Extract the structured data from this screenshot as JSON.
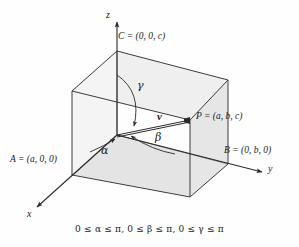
{
  "figure": {
    "background_color": "#fefefe",
    "line_color": "#3c3c3c",
    "face_shade_color": "#e8e8e8",
    "face_shade_color_dark": "#dedede",
    "axes": [
      {
        "name": "z",
        "label": "z"
      },
      {
        "name": "y",
        "label": "y"
      },
      {
        "name": "x",
        "label": "x"
      }
    ],
    "points": [
      {
        "name": "C",
        "label": "C = (0, 0, c)"
      },
      {
        "name": "P",
        "label": "P = (a, b, c)"
      },
      {
        "name": "B",
        "label": "B = (0, b, 0)"
      },
      {
        "name": "A",
        "label": "A = (a, 0, 0)"
      }
    ],
    "angles": [
      {
        "name": "alpha",
        "label": "α"
      },
      {
        "name": "beta",
        "label": "β"
      },
      {
        "name": "gamma",
        "label": "γ"
      }
    ],
    "vector": {
      "name": "v",
      "label": "v"
    },
    "caption": "0 ≤ α ≤ π, 0 ≤ β ≤ π, 0 ≤ γ ≤ π"
  }
}
